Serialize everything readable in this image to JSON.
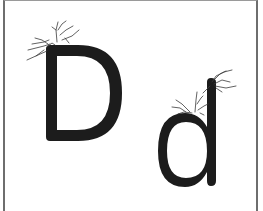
{
  "card": {
    "title": "Letter D flashcard",
    "uppercase_letter": "D",
    "lowercase_letter": "d",
    "letter_color": "#1c1c1c",
    "border_color": "#6e6e6e",
    "decoration": "hand-twig-doodle"
  }
}
